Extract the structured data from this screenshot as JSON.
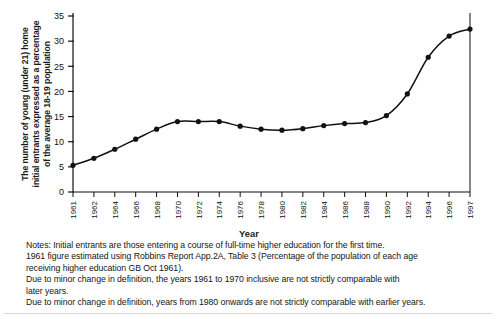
{
  "figure": {
    "ylabel_lines": [
      "The number of young (under 21) home",
      "initial entrants expressed as a percentage",
      "of the average 18-19 population"
    ],
    "xlabel": "Year",
    "notes": [
      "Notes: Initial entrants are those entering a course of full-time higher education for the first time.",
      "1961 figure estimated using Robbins Report App.2A, Table 3 (Percentage of the population of each age",
      "receiving higher education GB Oct 1961).",
      "Due to minor change in definition, the years 1961 to 1970 inclusive are not strictly comparable with",
      "later years.",
      "Due to minor change in definition, years from 1980 onwards are not strictly comparable with earlier years."
    ]
  },
  "chart_data": {
    "type": "line",
    "title": "",
    "xlabel": "Year",
    "ylabel": "The number of young (under 21) home initial entrants expressed as a percentage of the average 18-19 population",
    "x": [
      "1961",
      "1962",
      "1964",
      "1966",
      "1968",
      "1970",
      "1972",
      "1974",
      "1976",
      "1978",
      "1980",
      "1982",
      "1984",
      "1986",
      "1988",
      "1990",
      "1992",
      "1994",
      "1996",
      "1997"
    ],
    "values": [
      5.3,
      6.7,
      8.5,
      10.5,
      12.5,
      14.0,
      14.0,
      14.0,
      13.1,
      12.5,
      12.3,
      12.6,
      13.2,
      13.6,
      13.8,
      15.2,
      19.5,
      26.8,
      31.0,
      32.4
    ],
    "xtick_labels": [
      "1961",
      "1962",
      "1964",
      "1966",
      "1968",
      "1970",
      "1972",
      "1974",
      "1976",
      "1978",
      "1980",
      "1982",
      "1984",
      "1986",
      "1988",
      "1990",
      "1992",
      "1994",
      "1996",
      "1997"
    ],
    "ytick_labels": [
      "0",
      "5",
      "10",
      "15",
      "20",
      "25",
      "30",
      "35"
    ],
    "ytick_values": [
      0,
      5,
      10,
      15,
      20,
      25,
      30,
      35
    ],
    "ylim": [
      0,
      35
    ],
    "grid": false,
    "legend": "none",
    "marker": "filled-circle",
    "line_color": "#111111",
    "marker_color": "#111111"
  }
}
